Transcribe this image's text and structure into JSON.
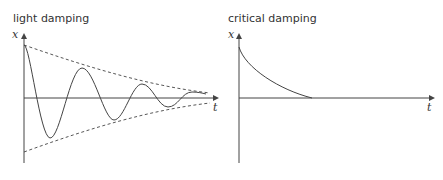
{
  "panels": [
    {
      "title": "light damping",
      "x_label": "x",
      "t_label": "t",
      "curve": "decaying oscillation with dashed exponential envelope"
    },
    {
      "title": "critical damping",
      "x_label": "x",
      "t_label": "t",
      "curve": "exponential decay to zero without oscillation"
    }
  ],
  "colors": {
    "line": "#444444",
    "text": "#333333"
  }
}
